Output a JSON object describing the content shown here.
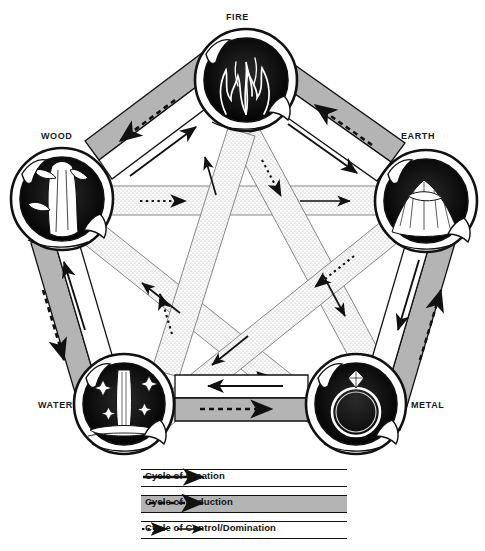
{
  "diagram": {
    "nodes": [
      {
        "id": "fire",
        "label": "FIRE",
        "icon": "flame-icon",
        "cx": 246,
        "cy": 80,
        "r": 51,
        "label_x": 226,
        "label_y": 12
      },
      {
        "id": "wood",
        "label": "WOOD",
        "icon": "tree-icon",
        "cx": 62,
        "cy": 199,
        "r": 51,
        "label_x": 40,
        "label_y": 131
      },
      {
        "id": "earth",
        "label": "EARTH",
        "icon": "mountain-icon",
        "cx": 426,
        "cy": 201,
        "r": 51,
        "label_x": 401,
        "label_y": 131
      },
      {
        "id": "water",
        "label": "WATER",
        "icon": "waterfall-icon",
        "cx": 124,
        "cy": 404,
        "r": 50,
        "label_x": 38,
        "label_y": 400
      },
      {
        "id": "metal",
        "label": "METAL",
        "icon": "ring-icon",
        "cx": 356,
        "cy": 404,
        "r": 50,
        "label_x": 411,
        "label_y": 400
      }
    ],
    "creation_cycle": [
      [
        "wood",
        "fire"
      ],
      [
        "fire",
        "earth"
      ],
      [
        "earth",
        "metal"
      ],
      [
        "metal",
        "water"
      ],
      [
        "water",
        "wood"
      ]
    ],
    "reduction_cycle": [
      [
        "fire",
        "wood"
      ],
      [
        "earth",
        "fire"
      ],
      [
        "metal",
        "earth"
      ],
      [
        "water",
        "metal"
      ],
      [
        "wood",
        "water"
      ]
    ],
    "control_cycle": [
      [
        "wood",
        "earth"
      ],
      [
        "earth",
        "water"
      ],
      [
        "water",
        "fire"
      ],
      [
        "fire",
        "metal"
      ],
      [
        "metal",
        "wood"
      ]
    ],
    "colors": {
      "ink": "#111111",
      "reduction_band": "#b4b4b4",
      "creation_band": "#ffffff",
      "control_band": "#efefef"
    }
  },
  "legend": {
    "rows": [
      {
        "label": "Cycle of Creation",
        "style": "solid",
        "band": "white"
      },
      {
        "label": "Cycle of Reduction",
        "style": "dashed",
        "band": "gray"
      },
      {
        "label": "Cycle of Control/Domination",
        "style": "dotted-and-solid",
        "band": "white"
      }
    ]
  }
}
